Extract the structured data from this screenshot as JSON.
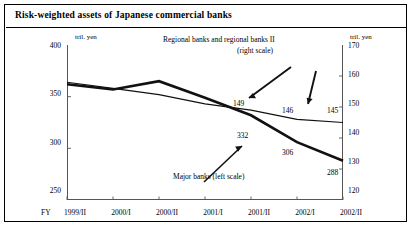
{
  "header": {
    "title": "Risk-weighted assets of Japanese commercial banks"
  },
  "chart_data": {
    "type": "line",
    "title": "Risk-weighted assets of Japanese commercial banks",
    "xlabel": "FY",
    "x_axis_prefix": "FY",
    "categories": [
      "1999/II",
      "2000/I",
      "2000/II",
      "2001/I",
      "2001/II",
      "2002/I",
      "2002/II"
    ],
    "left_unit": "tril. yen",
    "right_unit": "tril. yen",
    "ylabel": "tril. yen",
    "ylim": [
      250,
      400
    ],
    "y2lim": [
      120,
      170
    ],
    "yticks": [
      "400",
      "350",
      "300",
      "250"
    ],
    "ytick_values": [
      400,
      350,
      300,
      250
    ],
    "y2ticks": [
      "170",
      "160",
      "150",
      "140",
      "130",
      "120"
    ],
    "y2tick_values": [
      170,
      160,
      150,
      140,
      130,
      120
    ],
    "grid": false,
    "legend": "annotations",
    "series": [
      {
        "name": "Major banks (left scale)",
        "axis": "left",
        "style": "thick",
        "values": [
          362,
          357,
          365,
          349,
          332,
          306,
          288
        ]
      },
      {
        "name": "Regional banks and regional banks II (right scale)",
        "axis": "right",
        "style": "thin",
        "values": [
          158,
          156,
          154,
          151,
          149,
          146,
          145
        ]
      }
    ],
    "annotations": [
      {
        "text": "Regional banks and regional banks II",
        "name": "regional-banks-label-line1"
      },
      {
        "text": "(right scale)",
        "name": "regional-banks-label-line2"
      },
      {
        "text": "Major banks (left scale)",
        "name": "major-banks-label"
      }
    ],
    "data_labels": {
      "regional": [
        "149",
        "146",
        "145"
      ],
      "major": [
        "332",
        "306",
        "288"
      ]
    }
  }
}
